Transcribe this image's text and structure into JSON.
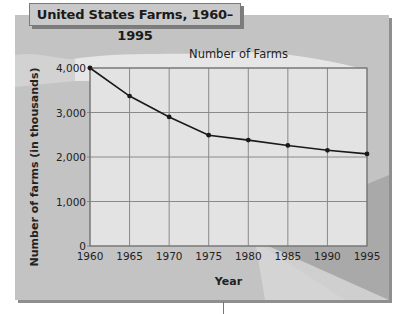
{
  "figure": {
    "title": "United States Farms, 1960–1995"
  },
  "chart_data": {
    "type": "line",
    "title": "Number of Farms",
    "xlabel": "Year",
    "ylabel": "Number of farms (in thousands)",
    "x": [
      1960,
      1965,
      1970,
      1975,
      1980,
      1985,
      1990,
      1995
    ],
    "series": [
      {
        "name": "Number of Farms",
        "values": [
          4000,
          3370,
          2900,
          2490,
          2380,
          2260,
          2150,
          2070
        ]
      }
    ],
    "xticks": [
      "1960",
      "1965",
      "1970",
      "1975",
      "1980",
      "1985",
      "1990",
      "1995"
    ],
    "yticks": [
      "0",
      "1,000",
      "2,000",
      "3,000",
      "4,000"
    ],
    "ytick_values": [
      0,
      1000,
      2000,
      3000,
      4000
    ],
    "ylim": [
      0,
      4000
    ],
    "xlim": [
      1960,
      1995
    ],
    "grid": true,
    "legend": null
  },
  "colors": {
    "panel": "#c3c3c3",
    "plot_background": "#e3e3e3",
    "gridline": "#8a8a8a",
    "line": "#1a1a1a",
    "cloud": "#e6e6e6",
    "shadow_band": "#a9a9a9"
  }
}
